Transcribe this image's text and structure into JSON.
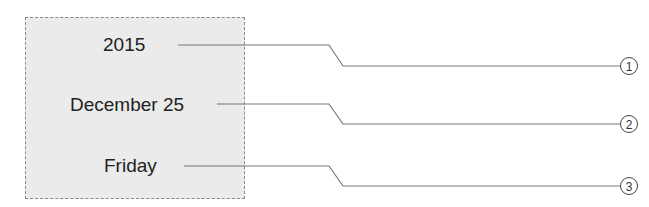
{
  "card": {
    "year": "2015",
    "date": "December 25",
    "weekday": "Friday"
  },
  "callouts": [
    {
      "number": "1",
      "target": "2015"
    },
    {
      "number": "2",
      "target": "December 25"
    },
    {
      "number": "3",
      "target": "Friday"
    }
  ],
  "colors": {
    "card_background": "#ebebeb",
    "border": "#8a8a8a",
    "leader_line": "#777777"
  }
}
